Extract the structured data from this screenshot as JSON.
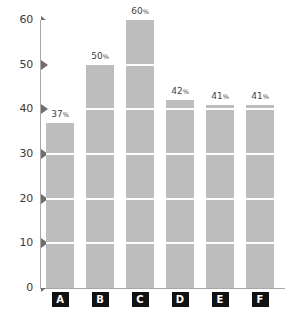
{
  "chart_data": {
    "type": "bar",
    "title": "",
    "subtitle": "",
    "xlabel": "",
    "ylabel": "",
    "categories": [
      "A",
      "B",
      "C",
      "D",
      "E",
      "F"
    ],
    "values": [
      37,
      50,
      60,
      42,
      41,
      41
    ],
    "value_labels": [
      "37%",
      "50%",
      "60%",
      "42%",
      "41%",
      "41%"
    ],
    "value_numbers": [
      "37",
      "50",
      "60",
      "42",
      "41",
      "41"
    ],
    "value_unit": "%",
    "ylim": [
      0,
      60
    ],
    "ytick_values": [
      60,
      50,
      40,
      30,
      20,
      10,
      0
    ],
    "ytick_labels": [
      "60",
      "50",
      "40",
      "30",
      "20",
      "10",
      "0"
    ],
    "ytick_step": 10,
    "grid": false,
    "legend": false,
    "legend_position": "none",
    "bar_color": "#bdbdbd",
    "axis_color": "#a8a8a8",
    "tick_marker_color": "#6e6e6e",
    "label_text_color": "#3a3a3a",
    "category_box_color": "#111111",
    "category_text_color": "#ffffff",
    "segment_gap_color": "#ffffff",
    "background": "#ffffff"
  },
  "axis": {
    "y_ticks": [
      {
        "label": "60",
        "value": 60,
        "marker": "triangle-small-down"
      },
      {
        "label": "50",
        "value": 50,
        "marker": "triangle-right"
      },
      {
        "label": "40",
        "value": 40,
        "marker": "triangle-right"
      },
      {
        "label": "30",
        "value": 30,
        "marker": "triangle-right"
      },
      {
        "label": "20",
        "value": 20,
        "marker": "triangle-right"
      },
      {
        "label": "10",
        "value": 10,
        "marker": "triangle-right"
      },
      {
        "label": "0",
        "value": 0,
        "marker": "triangle-small-up"
      }
    ]
  },
  "bars": [
    {
      "category": "A",
      "value": 37,
      "number": "37",
      "unit": "%",
      "label": "37%"
    },
    {
      "category": "B",
      "value": 50,
      "number": "50",
      "unit": "%",
      "label": "50%"
    },
    {
      "category": "C",
      "value": 60,
      "number": "60",
      "unit": "%",
      "label": "60%"
    },
    {
      "category": "D",
      "value": 42,
      "number": "42",
      "unit": "%",
      "label": "42%"
    },
    {
      "category": "E",
      "value": 41,
      "number": "41",
      "unit": "%",
      "label": "41%"
    },
    {
      "category": "F",
      "value": 41,
      "number": "41",
      "unit": "%",
      "label": "41%"
    }
  ]
}
